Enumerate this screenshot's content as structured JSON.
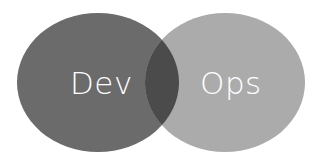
{
  "diagram": {
    "type": "venn",
    "sets": [
      {
        "label": "Dev",
        "color": "#6b6b6b"
      },
      {
        "label": "Ops",
        "color": "#ababab"
      }
    ],
    "overlap_color": "#4b4b4b",
    "label_color": "#ffffff"
  }
}
